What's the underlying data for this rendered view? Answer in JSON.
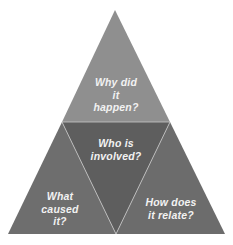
{
  "diagram": {
    "type": "triangle-of-four",
    "colors": {
      "top": "#8f8f8f",
      "center": "#5e5e5e",
      "left": "#6e6e6e",
      "right": "#6c6c6c",
      "divider": "#c8c8c8",
      "text": "#f2f2f2"
    },
    "segments": [
      {
        "id": "top",
        "label": "Why did\nit\nhappen?"
      },
      {
        "id": "center",
        "label": "Who is\ninvolved?"
      },
      {
        "id": "left",
        "label": "What\ncaused\nit?"
      },
      {
        "id": "right",
        "label": "How does\nit relate?"
      }
    ]
  }
}
